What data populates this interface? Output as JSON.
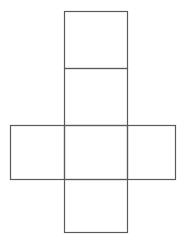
{
  "diagram": {
    "type": "cube-net",
    "canvas": {
      "width": 184,
      "height": 242
    },
    "stroke_color": "#5a5a5a",
    "stroke_width": 1.2,
    "background": "#ffffff",
    "faces": [
      {
        "id": "top",
        "x": 64,
        "y": 11,
        "w": 63,
        "h": 57
      },
      {
        "id": "upper-mid",
        "x": 64,
        "y": 68,
        "w": 63,
        "h": 57
      },
      {
        "id": "left",
        "x": 10,
        "y": 125,
        "w": 54,
        "h": 54
      },
      {
        "id": "center",
        "x": 64,
        "y": 125,
        "w": 63,
        "h": 54
      },
      {
        "id": "right",
        "x": 127,
        "y": 125,
        "w": 48,
        "h": 54
      },
      {
        "id": "bottom",
        "x": 64,
        "y": 179,
        "w": 63,
        "h": 53
      }
    ]
  }
}
